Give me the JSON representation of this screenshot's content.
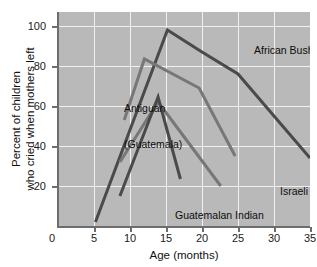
{
  "chart_data": {
    "type": "line",
    "title": "",
    "xlabel": "Age (months)",
    "ylabel": "Percent of children\nwho cried when mothers left",
    "ylabel_line1": "Percent of children",
    "ylabel_line2": "who cried when mothers left",
    "xlim": [
      0,
      35
    ],
    "ylim": [
      0,
      107
    ],
    "xticks": [
      0,
      5,
      10,
      15,
      20,
      25,
      30,
      35
    ],
    "xtick_labels": [
      "0",
      "5",
      "10",
      "15",
      "20",
      "25",
      "30",
      "35"
    ],
    "yticks": [
      20,
      40,
      60,
      80,
      100
    ],
    "ytick_labels": [
      "20",
      "40",
      "60",
      "80",
      "100"
    ],
    "grid": true,
    "grid_color": "#f1f1f1",
    "plot_background": "#b9b9b9",
    "legend_position": "inline-annotations",
    "series": [
      {
        "name": "African Bushman",
        "color": "#4a4a4a",
        "line_width": 3,
        "points": [
          {
            "x": 5.2,
            "y": 2
          },
          {
            "x": 15.2,
            "y": 98
          },
          {
            "x": 20.0,
            "y": 87
          },
          {
            "x": 25.0,
            "y": 76
          },
          {
            "x": 35.0,
            "y": 34
          }
        ],
        "label": "African Bushman",
        "label_x": 20.6,
        "label_y": 90
      },
      {
        "name": "Antiguan (Guatemala)",
        "color": "#777777",
        "line_width": 3,
        "points": [
          {
            "x": 9.2,
            "y": 53
          },
          {
            "x": 12.0,
            "y": 83.5
          },
          {
            "x": 19.6,
            "y": 69
          },
          {
            "x": 24.6,
            "y": 35
          }
        ],
        "label": "Antiguan\n(Guatemala)",
        "label_line1": "Antiguan",
        "label_line2": "(Guatemala)",
        "label_x": 6.2,
        "label_y": 73
      },
      {
        "name": "Israeli kibbutzim",
        "color": "#777777",
        "line_width": 3,
        "points": [
          {
            "x": 8.6,
            "y": 32
          },
          {
            "x": 13.9,
            "y": 62
          },
          {
            "x": 22.6,
            "y": 20
          }
        ],
        "label": "Israeli kibbutzim",
        "label_x": 23.8,
        "label_y": 24
      },
      {
        "name": "Guatemalan Indian",
        "color": "#4a4a4a",
        "line_width": 3,
        "points": [
          {
            "x": 8.6,
            "y": 15
          },
          {
            "x": 13.9,
            "y": 64.5
          },
          {
            "x": 17.0,
            "y": 23.5
          }
        ],
        "label": "Guatemalan Indian",
        "label_x": 11.0,
        "label_y": 12
      }
    ]
  },
  "axis": {
    "x_title": "Age (months)",
    "y_title_line1": "Percent of children",
    "y_title_line2": "who cried when mothers left"
  },
  "annotations": {
    "african_bushman": "African Bushman",
    "antiguan_line1": "Antiguan",
    "antiguan_line2": "(Guatemala)",
    "israeli_kibbutzim": "Israeli kibbutzim",
    "guatemalan_indian": "Guatemalan Indian"
  },
  "colors": {
    "plot_background": "#b9b9b9",
    "grid": "#f1f1f1",
    "axis": "#6d6d6d",
    "series_dark": "#4a4a4a",
    "series_mid": "#777777",
    "text": "#1a1a1a"
  }
}
